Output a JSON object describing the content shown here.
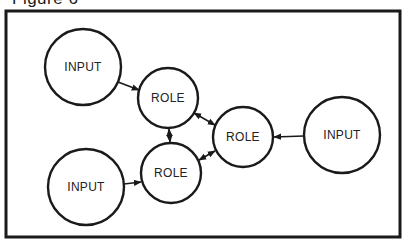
{
  "figure": {
    "title": "Figure 6"
  },
  "diagram": {
    "frame": {
      "x": 6,
      "y": 11,
      "width": 394,
      "height": 226
    },
    "nodes": [
      {
        "id": "input-top-left",
        "label": "INPUT",
        "type": "input",
        "cx": 83,
        "cy": 67,
        "r": 38
      },
      {
        "id": "role-top",
        "label": "ROLE",
        "type": "role",
        "cx": 168,
        "cy": 98,
        "r": 30
      },
      {
        "id": "role-right",
        "label": "ROLE",
        "type": "role",
        "cx": 243,
        "cy": 137,
        "r": 30
      },
      {
        "id": "role-bottom",
        "label": "ROLE",
        "type": "role",
        "cx": 171,
        "cy": 173,
        "r": 30
      },
      {
        "id": "input-right",
        "label": "INPUT",
        "type": "input",
        "cx": 342,
        "cy": 135,
        "r": 38
      },
      {
        "id": "input-bottom-left",
        "label": "INPUT",
        "type": "input",
        "cx": 86,
        "cy": 187,
        "r": 38
      }
    ],
    "edges": [
      {
        "from": "input-top-left",
        "to": "role-top",
        "direction": "forward"
      },
      {
        "from": "role-top",
        "to": "role-bottom",
        "direction": "both"
      },
      {
        "from": "role-top",
        "to": "role-right",
        "direction": "both"
      },
      {
        "from": "role-right",
        "to": "role-bottom",
        "direction": "both"
      },
      {
        "from": "input-right",
        "to": "role-right",
        "direction": "forward"
      },
      {
        "from": "input-bottom-left",
        "to": "role-bottom",
        "direction": "forward"
      }
    ],
    "colors": {
      "stroke": "#1a1a1a",
      "background": "#ffffff"
    }
  }
}
